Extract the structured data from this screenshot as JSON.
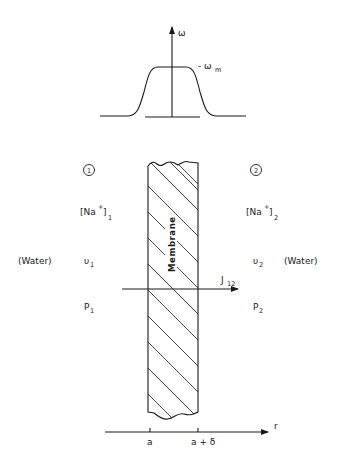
{
  "figure": {
    "type": "membrane transport schematic",
    "top_plot": {
      "axis_label": "ω",
      "plateau_label": "- ω",
      "plateau_label_subscript": "m",
      "description": "trapezoid-like profile of ω across membrane with plateau value ω_m"
    },
    "compartments": {
      "left": {
        "number": "1",
        "concentration_main": "[Na",
        "concentration_sup": "+",
        "concentration_close": "]",
        "concentration_sub": "1",
        "velocity_main": "υ",
        "velocity_sub": "1",
        "pressure_main": "P",
        "pressure_sub": "1",
        "medium": "(Water)"
      },
      "right": {
        "number": "2",
        "concentration_main": "[Na",
        "concentration_sup": "+",
        "concentration_close": "]",
        "concentration_sub": "2",
        "velocity_main": "υ",
        "velocity_sub": "2",
        "pressure_main": "P",
        "pressure_sub": "2",
        "medium": "(Water)"
      }
    },
    "membrane": {
      "label": "Membrane"
    },
    "flux": {
      "main": "J",
      "sub": "12"
    },
    "bottom_axis": {
      "axis_label": "r",
      "ticks": [
        "a",
        "a + δ"
      ]
    }
  }
}
